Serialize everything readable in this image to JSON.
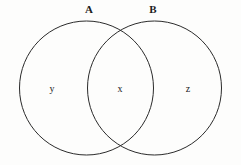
{
  "diagram": {
    "type": "venn-diagram",
    "background_color": "#fdfdfc",
    "stroke_color": "#2b2b2b",
    "text_color": "#1c1c1c",
    "sets": [
      {
        "id": "A",
        "label": "A",
        "label_position": {
          "x": 89,
          "y": 10
        },
        "circle": {
          "cx": 86.5,
          "cy": 88,
          "r": 67
        }
      },
      {
        "id": "B",
        "label": "B",
        "label_position": {
          "x": 153,
          "y": 10
        },
        "circle": {
          "cx": 154.5,
          "cy": 88,
          "r": 67
        }
      }
    ],
    "regions": [
      {
        "id": "a-only",
        "label": "y",
        "description": "A only",
        "position": {
          "x": 52,
          "y": 89
        }
      },
      {
        "id": "intersection",
        "label": "x",
        "description": "A intersect B",
        "position": {
          "x": 120,
          "y": 89
        }
      },
      {
        "id": "b-only",
        "label": "z",
        "description": "B only",
        "position": {
          "x": 188,
          "y": 89
        }
      }
    ]
  }
}
